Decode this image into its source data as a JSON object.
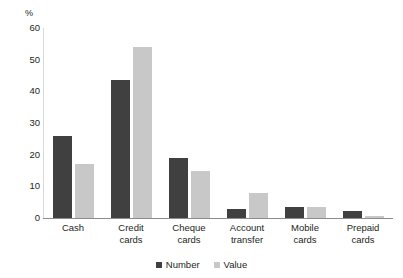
{
  "chart_data": {
    "type": "bar",
    "title": "",
    "subtitle": "",
    "xlabel": "",
    "ylabel": "",
    "unit_label": "%",
    "ylim": [
      0,
      60
    ],
    "yticks": [
      60,
      50,
      40,
      30,
      20,
      10,
      0
    ],
    "grid": false,
    "legend_position": "bottom-center",
    "categories": [
      "Cash",
      "Credit cards",
      "Cheque cards",
      "Account transfer",
      "Mobile cards",
      "Prepaid cards"
    ],
    "category_lines": [
      [
        "Cash"
      ],
      [
        "Credit",
        "cards"
      ],
      [
        "Cheque",
        "cards"
      ],
      [
        "Account",
        "transfer"
      ],
      [
        "Mobile",
        "cards"
      ],
      [
        "Prepaid",
        "cards"
      ]
    ],
    "series": [
      {
        "name": "Number",
        "color": "#404040",
        "values": [
          26,
          43.5,
          19,
          3,
          3.5,
          2.3
        ]
      },
      {
        "name": "Value",
        "color": "#c8c8c8",
        "values": [
          17,
          54,
          15,
          7.8,
          3.5,
          0.5
        ]
      }
    ]
  }
}
